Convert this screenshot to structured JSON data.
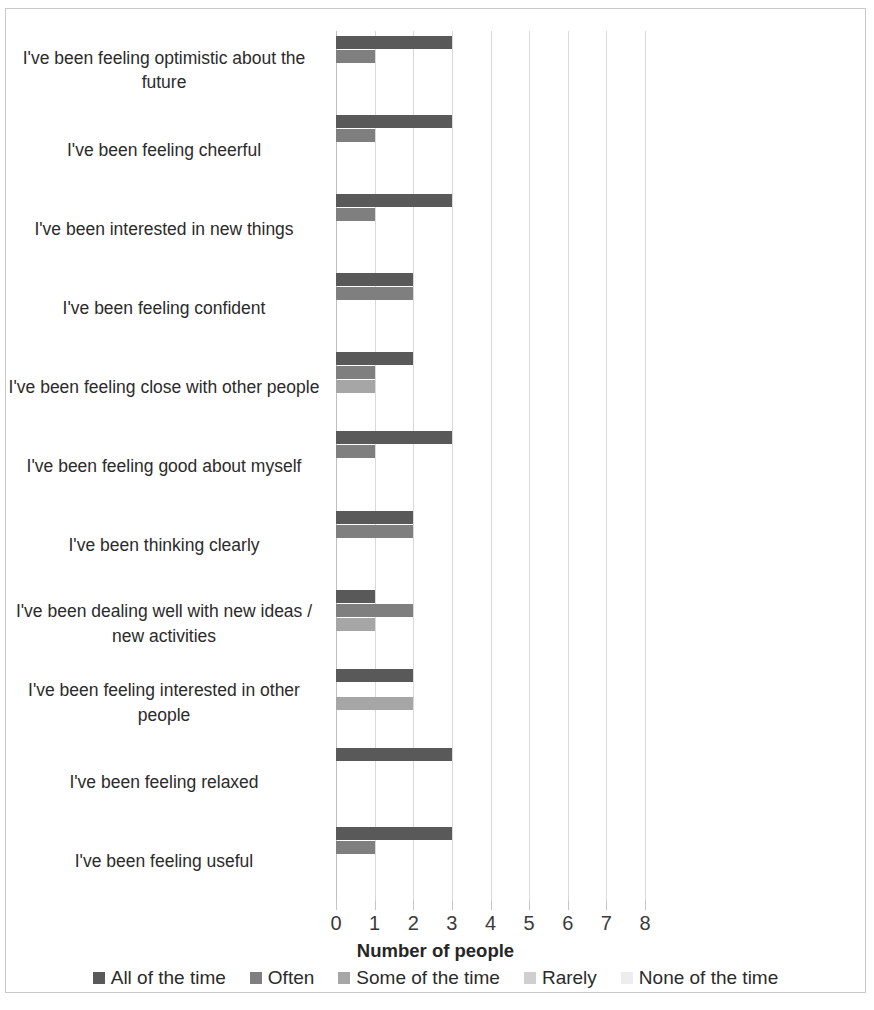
{
  "chart_data": {
    "type": "bar",
    "orientation": "horizontal",
    "title": "",
    "xlabel": "Number of people",
    "ylabel": "",
    "xlim": [
      0,
      8
    ],
    "x_ticks": [
      "0",
      "1",
      "2",
      "3",
      "4",
      "5",
      "6",
      "7",
      "8"
    ],
    "grid": true,
    "legend_position": "bottom",
    "categories": [
      "I've been feeling optimistic about the future",
      "I've been feeling cheerful",
      "I've been interested in new things",
      "I've been feeling confident",
      "I've been feeling close with other people",
      "I've been feeling good about myself",
      "I've been thinking clearly",
      "I've been dealing well with new ideas / new activities",
      "I've been feeling interested in other people",
      "I've been feeling relaxed",
      "I've been feeling useful"
    ],
    "series": [
      {
        "name": "All of the time",
        "color": "#595959",
        "values": [
          3,
          3,
          3,
          2,
          2,
          3,
          2,
          1,
          2,
          3,
          3
        ]
      },
      {
        "name": "Often",
        "color": "#7f7f7f",
        "values": [
          1,
          1,
          1,
          2,
          1,
          1,
          2,
          2,
          0,
          0,
          1
        ]
      },
      {
        "name": "Some of the time",
        "color": "#a6a6a6",
        "values": [
          0,
          0,
          0,
          0,
          1,
          0,
          0,
          1,
          2,
          0,
          0
        ]
      },
      {
        "name": "Rarely",
        "color": "#cfcfcf",
        "values": [
          0,
          0,
          0,
          0,
          0,
          0,
          0,
          0,
          0,
          0,
          0
        ]
      },
      {
        "name": "None of the time",
        "color": "#ededed",
        "values": [
          0,
          0,
          0,
          0,
          0,
          0,
          0,
          0,
          0,
          0,
          0
        ]
      }
    ]
  }
}
